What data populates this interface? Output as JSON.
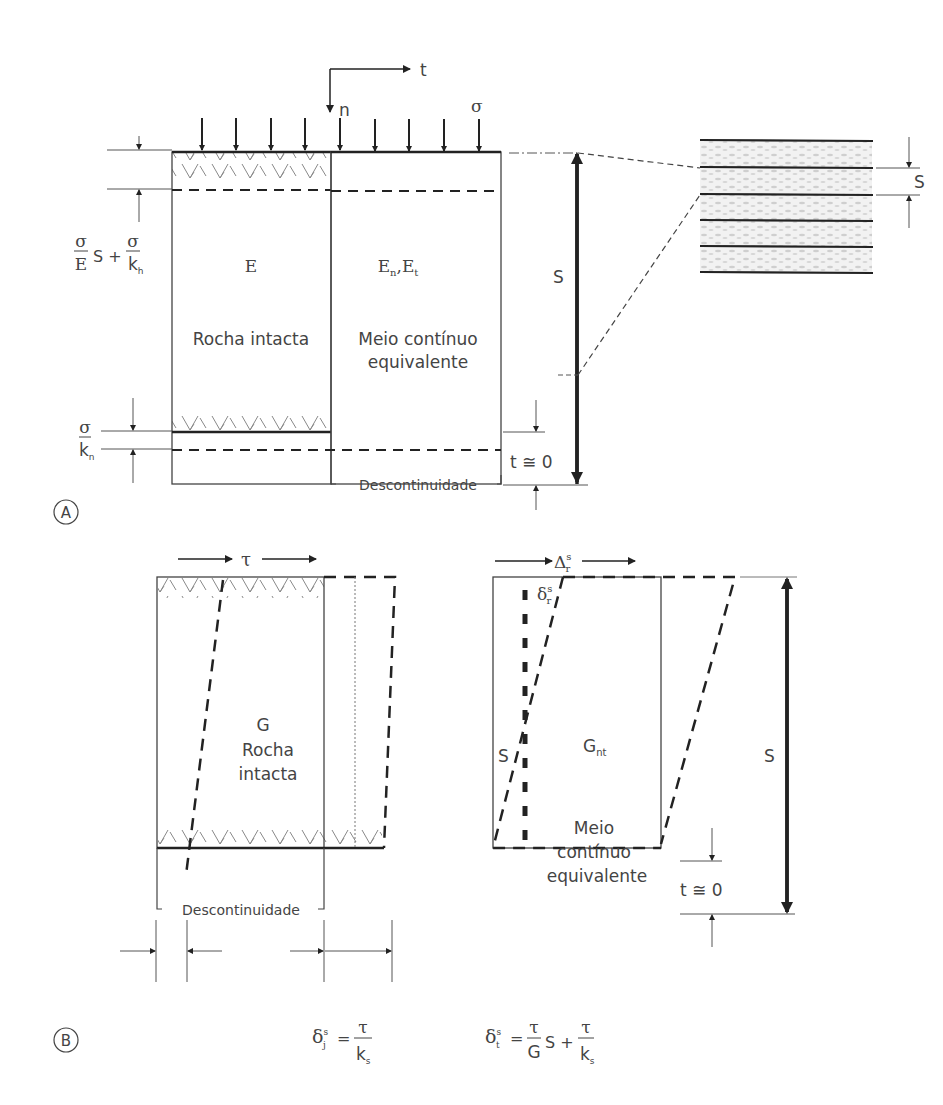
{
  "panel_a": {
    "marker": "A",
    "axis_t": "t",
    "axis_n": "n",
    "load_symbol": "σ",
    "left_block": {
      "modulus": "E",
      "label": "Rocha intacta"
    },
    "right_block": {
      "modulus": "E",
      "modulus_sub": "n",
      "modulus2": "E",
      "modulus2_sub": "t",
      "label_line1": "Meio contínuo",
      "label_line2": "equivalente"
    },
    "eq_top": {
      "num1": "σ",
      "den1": "E",
      "mid": "S +",
      "num2": "σ",
      "den2": "k",
      "den2_sub": "h"
    },
    "eq_bottom": {
      "num": "σ",
      "den": "k",
      "den_sub": "n"
    },
    "discontinuity_label": "Descontinuidade",
    "t_approx": "t ≅ 0",
    "spacing_label": "S",
    "detail_spacing_label": "S"
  },
  "panel_b": {
    "marker": "B",
    "left_block": {
      "shear": "τ",
      "modulus": "G",
      "label_line1": "Rocha",
      "label_line2": "intacta"
    },
    "right_block": {
      "disp_top": "Δ",
      "disp_top_sup": "s",
      "disp_top_sub": "r",
      "disp_inner": "δ",
      "disp_inner_sup": "s",
      "disp_inner_sub": "r",
      "modulus": "G",
      "modulus_sub": "nt",
      "label_line1": "Meio",
      "label_line2": "contínuo",
      "label_line3": "equivalente",
      "s_inner": "S"
    },
    "discontinuity_label": "Descontinuidade",
    "t_approx": "t ≅ 0",
    "spacing_label": "S",
    "eq_left": {
      "lhs": "δ",
      "lhs_sup": "s",
      "lhs_sub": "j",
      "eq": "=",
      "num": "τ",
      "den": "k",
      "den_sub": "s"
    },
    "eq_right": {
      "lhs": "δ",
      "lhs_sup": "s",
      "lhs_sub": "t",
      "eq": "=",
      "num1": "τ",
      "den1": "G",
      "mid": "S +",
      "num2": "τ",
      "den2": "k",
      "den2_sub": "s"
    }
  }
}
